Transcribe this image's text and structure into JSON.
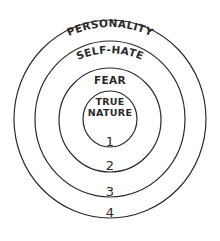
{
  "diagram": {
    "type": "concentric-circles",
    "layers": [
      {
        "index": 1,
        "number_label": "1",
        "name_line1": "TRUE",
        "name_line2": "NATURE"
      },
      {
        "index": 2,
        "number_label": "2",
        "name": "FEAR"
      },
      {
        "index": 3,
        "number_label": "3",
        "name": "SELF-HATE"
      },
      {
        "index": 4,
        "number_label": "4",
        "name": "PERSONALITY"
      }
    ],
    "stroke_color": "#2a2a2a",
    "background": "#ffffff"
  }
}
